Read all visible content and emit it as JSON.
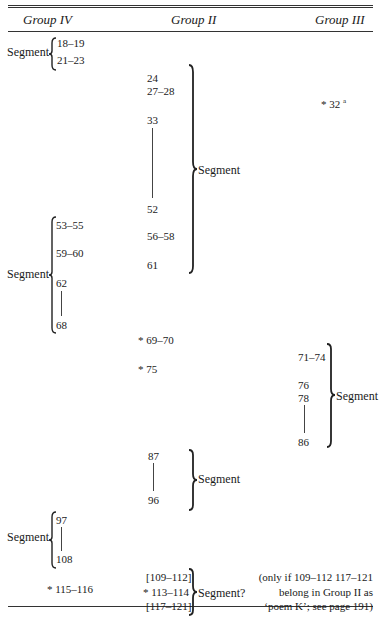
{
  "header": {
    "col1": "Group IV",
    "col2": "Group II",
    "col3": "Group III"
  },
  "group_iv": {
    "seg1_label": "Segment",
    "seg1_items": [
      "18–19",
      "21–23"
    ],
    "seg2_label": "Segment",
    "seg2_items": [
      "53–55",
      "59–60",
      "62",
      "68"
    ],
    "seg3_label": "Segment",
    "seg3_items": [
      "97",
      "108"
    ],
    "starred": "115–116",
    "star": "*"
  },
  "group_ii": {
    "seg1_items": [
      "24",
      "27–28",
      "33",
      "52",
      "56–58",
      "61"
    ],
    "seg1_label": "Segment",
    "starred1": "69–70",
    "starred2": "75",
    "star": "*",
    "seg2_items": [
      "87",
      "96"
    ],
    "seg2_label": "Segment",
    "seg3_items": [
      "[109–112]",
      "113–114",
      "[117–121]"
    ],
    "seg3_label": "Segment?"
  },
  "group_iii": {
    "starred": "32",
    "star": "*",
    "superscript": "a",
    "seg_items": [
      "71–74",
      "76",
      "78",
      "86"
    ],
    "seg_label": "Segment"
  },
  "note": {
    "line1": "(only if 109–112 117–121",
    "line2": "belong in Group II as",
    "line3": "‘poem K’; see page 191)"
  }
}
